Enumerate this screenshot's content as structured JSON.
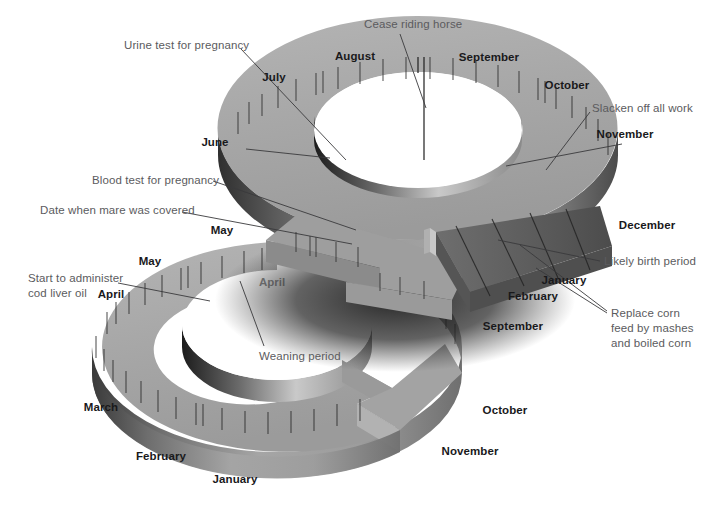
{
  "figure": {
    "kind": "3d-ring-calendar-diagram",
    "background_color": "#ffffff",
    "ring_top_color": "#a9a9a9",
    "ring_side_color": "#8e8e8e",
    "ring_dark_color": "#4a4a4a",
    "birth_segment_color": "#6b6b6b",
    "label_color_month": "#19191b",
    "label_color_note": "#5b5b5e",
    "leader_line_color": "#3a3a3c"
  },
  "rings": [
    {
      "id": "upper-ring",
      "name": "gestation-ring",
      "months": [
        {
          "label": "July",
          "x": 274,
          "y": 78,
          "anchor": "center"
        },
        {
          "label": "August",
          "x": 355,
          "y": 57,
          "anchor": "center"
        },
        {
          "label": "September",
          "x": 489,
          "y": 58,
          "anchor": "center"
        },
        {
          "label": "October",
          "x": 567,
          "y": 86,
          "anchor": "center"
        },
        {
          "label": "November",
          "x": 625,
          "y": 135,
          "anchor": "center"
        },
        {
          "label": "December",
          "x": 647,
          "y": 226,
          "anchor": "center"
        },
        {
          "label": "January",
          "x": 564,
          "y": 281,
          "anchor": "center"
        },
        {
          "label": "February",
          "x": 533,
          "y": 297,
          "anchor": "center"
        },
        {
          "label": "June",
          "x": 215,
          "y": 143,
          "anchor": "center"
        },
        {
          "label": "May",
          "x": 222,
          "y": 231,
          "anchor": "center"
        }
      ],
      "notes": [
        {
          "label": "Cease riding horse",
          "x": 364,
          "y": 24,
          "anchor": "left"
        },
        {
          "label": "Urine test for pregnancy",
          "x": 124,
          "y": 40,
          "anchor": "left"
        },
        {
          "label": "Slacken off all work",
          "x": 592,
          "y": 103,
          "anchor": "left"
        },
        {
          "label": "Blood test for pregnancy",
          "x": 92,
          "y": 174,
          "anchor": "left"
        },
        {
          "label": "Date when mare was covered",
          "x": 40,
          "y": 203,
          "anchor": "left"
        },
        {
          "label": "Likely birth period",
          "x": 604,
          "y": 256,
          "anchor": "left"
        }
      ]
    },
    {
      "id": "lower-ring",
      "name": "foal-rearing-ring",
      "months": [
        {
          "label": "May",
          "x": 150,
          "y": 262,
          "anchor": "center"
        },
        {
          "label": "April",
          "x": 111,
          "y": 295,
          "anchor": "center"
        },
        {
          "label": "March",
          "x": 101,
          "y": 408,
          "anchor": "center"
        },
        {
          "label": "February",
          "x": 161,
          "y": 457,
          "anchor": "center"
        },
        {
          "label": "January",
          "x": 235,
          "y": 480,
          "anchor": "center"
        },
        {
          "label": "September",
          "x": 513,
          "y": 327,
          "anchor": "center"
        },
        {
          "label": "October",
          "x": 505,
          "y": 411,
          "anchor": "center"
        },
        {
          "label": "November",
          "x": 470,
          "y": 452,
          "anchor": "center"
        }
      ],
      "occluded_months": [
        {
          "label": "April",
          "x": 272,
          "y": 283,
          "anchor": "center"
        }
      ],
      "notes": [
        {
          "label": "Start to administer\ncod liver oil",
          "x": 28,
          "y": 272,
          "anchor": "left"
        },
        {
          "label": "Weaning period",
          "x": 259,
          "y": 351,
          "anchor": "left"
        },
        {
          "label": "Replace corn\nfeed by mashes\nand boiled corn",
          "x": 611,
          "y": 307,
          "anchor": "left"
        }
      ]
    }
  ],
  "callout_lines": [
    {
      "name": "cease-riding-horse-leader",
      "points": "400,34 425,109 424,160"
    },
    {
      "name": "urine-test-leader",
      "points": "241,49 344,159"
    },
    {
      "name": "slacken-off-work-leader",
      "points": "590,112 545,168"
    },
    {
      "name": "blood-test-leader",
      "points": "213,181 352,229"
    },
    {
      "name": "date-covered-leader",
      "points": "182,211 350,243"
    },
    {
      "name": "likely-birth-leader",
      "points": "600,261 497,241"
    },
    {
      "name": "replace-corn-leader-a",
      "points": "609,312 523,246"
    },
    {
      "name": "replace-corn-leader-b",
      "points": "609,314 540,268"
    },
    {
      "name": "cod-liver-oil-leader",
      "points": "120,282 208,300"
    },
    {
      "name": "weaning-period-leader",
      "points": "264,346 239,280"
    },
    {
      "name": "june-leader",
      "points": "244,148 320,158"
    },
    {
      "name": "november-leader",
      "points": "623,143 505,165"
    }
  ]
}
